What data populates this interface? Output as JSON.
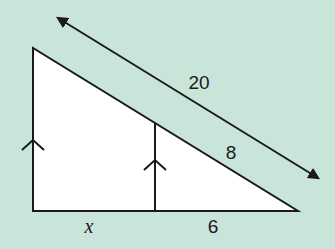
{
  "diagram": {
    "type": "similar-triangles",
    "background_color": "#c9e5d9",
    "fill_color": "#ffffff",
    "stroke_color": "#1a1a1a",
    "labels": {
      "hypotenuse_total": "20",
      "hypotenuse_small_segment": "8",
      "base_left_segment": "x",
      "base_right_segment": "6"
    },
    "markers": {
      "parallel_marks": 2,
      "double_arrow_along_hypotenuse": true
    }
  }
}
